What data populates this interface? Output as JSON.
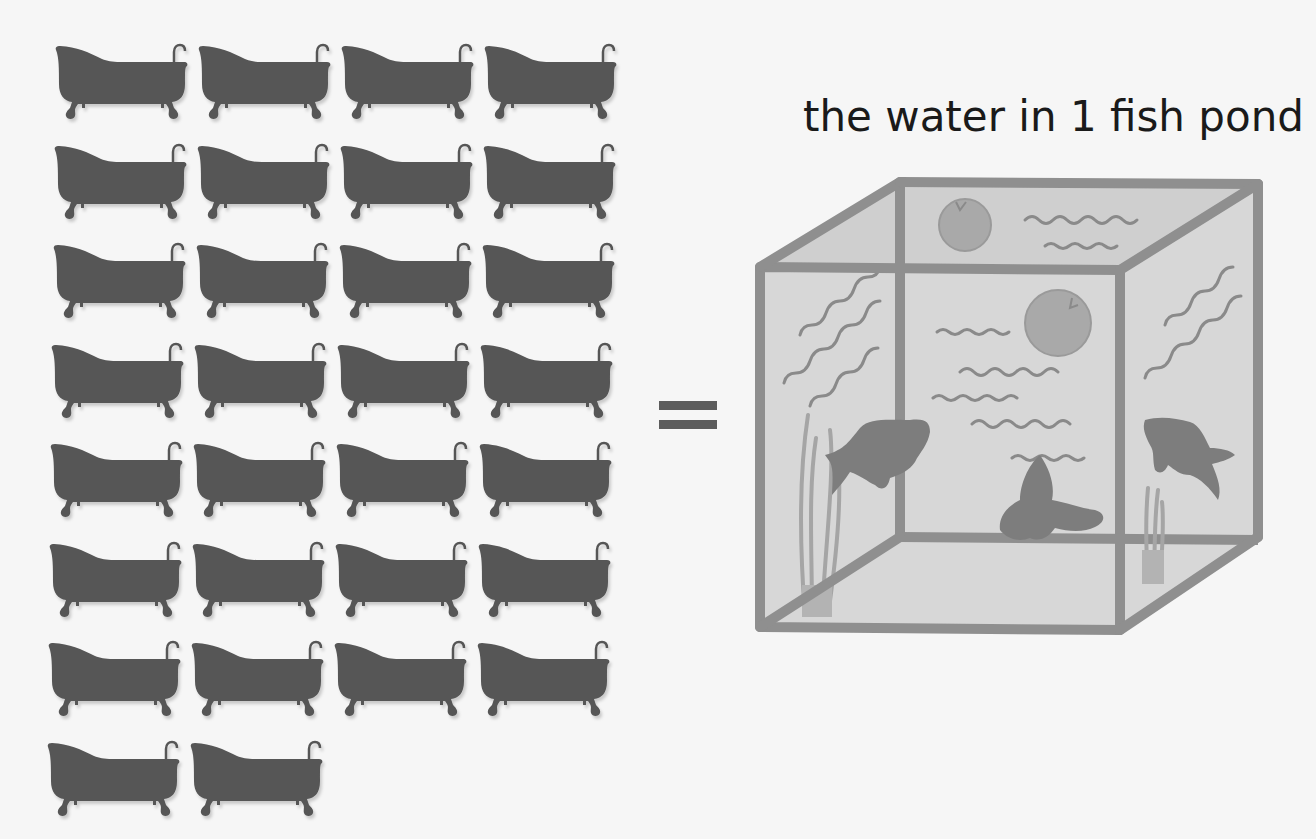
{
  "illustration": {
    "caption": "the water in 1 fish pond",
    "equals_symbol": "=",
    "bathtubs": {
      "count": 30,
      "columns": 4,
      "rows": 8,
      "icon": "bathtub-icon",
      "color": "#565656"
    },
    "fish_tank": {
      "icon": "fish-tank-icon",
      "fish_count": 3,
      "lily_pads": 2,
      "plants": 2,
      "frame_color": "#8e8e8e",
      "water_color": "#d6d6d6",
      "fish_color": "#7d7d7d",
      "pad_color": "#a8a8a8"
    },
    "background_color": "#f6f6f6"
  }
}
